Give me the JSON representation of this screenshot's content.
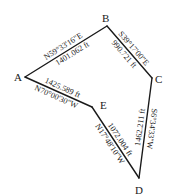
{
  "diagram": {
    "type": "traverse-survey-plot",
    "background": "#ffffff",
    "line_color": "#1a1a1a",
    "vertices": [
      {
        "id": "A",
        "label": "A",
        "x": 25,
        "y": 77
      },
      {
        "id": "B",
        "label": "B",
        "x": 107,
        "y": 26
      },
      {
        "id": "C",
        "label": "C",
        "x": 152,
        "y": 78
      },
      {
        "id": "D",
        "label": "D",
        "x": 139,
        "y": 178
      },
      {
        "id": "E",
        "label": "E",
        "x": 92,
        "y": 107
      }
    ],
    "courses": [
      {
        "from": "A",
        "to": "B",
        "bearing": "N59°33'16\"E",
        "distance": "1401.062 ft"
      },
      {
        "from": "B",
        "to": "C",
        "bearing": "S39°17'00\"E",
        "distance": "990.721 ft"
      },
      {
        "from": "C",
        "to": "D",
        "bearing": "S6°34'33\"W",
        "distance": "1462.211 ft"
      },
      {
        "from": "D",
        "to": "E",
        "bearing": "N17°48'10\"W",
        "distance": "1072.004 ft"
      },
      {
        "from": "E",
        "to": "A",
        "bearing": "N70°00'30\"W",
        "distance": "1425.589 ft"
      }
    ]
  }
}
